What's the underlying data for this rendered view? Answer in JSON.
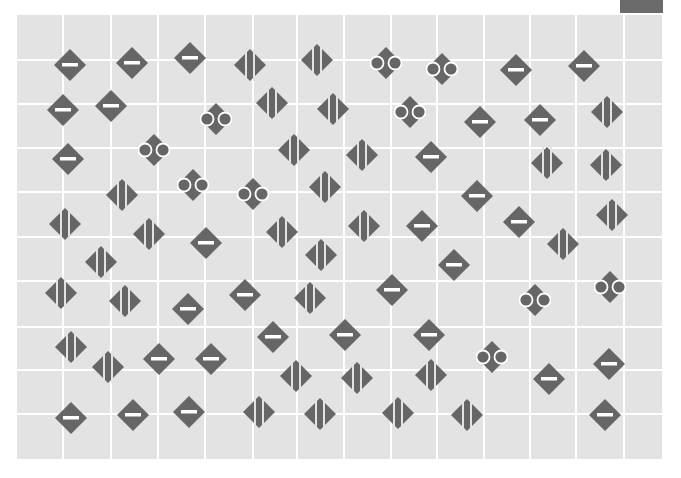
{
  "board": {
    "background": "#e3e3e3",
    "grid_color": "#ffffff",
    "piece_color": "#666666",
    "vertical_lines_x": [
      63,
      111,
      158,
      205,
      253,
      297,
      344,
      391,
      437,
      484,
      530,
      576,
      624
    ],
    "horizontal_lines_y": [
      60,
      104,
      148,
      192,
      237,
      281,
      327,
      370,
      414
    ]
  },
  "corner_block": {
    "color": "#6b6b6b"
  },
  "piece_types": {
    "dash": "diamond-with-horizontal-bar",
    "stripe": "diamond-with-vertical-stripes",
    "circles": "diamond-with-side-rings"
  },
  "pieces": [
    {
      "x": 70,
      "y": 65,
      "type": "dash"
    },
    {
      "x": 132,
      "y": 63,
      "type": "dash"
    },
    {
      "x": 190,
      "y": 58,
      "type": "dash"
    },
    {
      "x": 250,
      "y": 65,
      "type": "stripe"
    },
    {
      "x": 317,
      "y": 60,
      "type": "stripe"
    },
    {
      "x": 384,
      "y": 61,
      "type": "circles"
    },
    {
      "x": 440,
      "y": 67,
      "type": "circles"
    },
    {
      "x": 516,
      "y": 70,
      "type": "dash"
    },
    {
      "x": 584,
      "y": 66,
      "type": "dash"
    },
    {
      "x": 63,
      "y": 110,
      "type": "dash"
    },
    {
      "x": 111,
      "y": 106,
      "type": "dash"
    },
    {
      "x": 214,
      "y": 117,
      "type": "circles"
    },
    {
      "x": 272,
      "y": 103,
      "type": "stripe"
    },
    {
      "x": 333,
      "y": 109,
      "type": "stripe"
    },
    {
      "x": 408,
      "y": 110,
      "type": "circles"
    },
    {
      "x": 480,
      "y": 122,
      "type": "dash"
    },
    {
      "x": 540,
      "y": 120,
      "type": "dash"
    },
    {
      "x": 607,
      "y": 112,
      "type": "stripe"
    },
    {
      "x": 68,
      "y": 159,
      "type": "dash"
    },
    {
      "x": 152,
      "y": 148,
      "type": "circles"
    },
    {
      "x": 294,
      "y": 150,
      "type": "stripe"
    },
    {
      "x": 362,
      "y": 155,
      "type": "stripe"
    },
    {
      "x": 431,
      "y": 157,
      "type": "dash"
    },
    {
      "x": 547,
      "y": 163,
      "type": "stripe"
    },
    {
      "x": 606,
      "y": 165,
      "type": "stripe"
    },
    {
      "x": 122,
      "y": 195,
      "type": "stripe"
    },
    {
      "x": 191,
      "y": 183,
      "type": "circles"
    },
    {
      "x": 251,
      "y": 192,
      "type": "circles"
    },
    {
      "x": 325,
      "y": 187,
      "type": "stripe"
    },
    {
      "x": 477,
      "y": 196,
      "type": "dash"
    },
    {
      "x": 519,
      "y": 222,
      "type": "dash"
    },
    {
      "x": 612,
      "y": 215,
      "type": "stripe"
    },
    {
      "x": 65,
      "y": 224,
      "type": "stripe"
    },
    {
      "x": 149,
      "y": 234,
      "type": "stripe"
    },
    {
      "x": 206,
      "y": 243,
      "type": "dash"
    },
    {
      "x": 282,
      "y": 232,
      "type": "stripe"
    },
    {
      "x": 364,
      "y": 226,
      "type": "stripe"
    },
    {
      "x": 422,
      "y": 226,
      "type": "dash"
    },
    {
      "x": 454,
      "y": 265,
      "type": "dash"
    },
    {
      "x": 563,
      "y": 244,
      "type": "stripe"
    },
    {
      "x": 101,
      "y": 262,
      "type": "stripe"
    },
    {
      "x": 321,
      "y": 255,
      "type": "stripe"
    },
    {
      "x": 61,
      "y": 293,
      "type": "stripe"
    },
    {
      "x": 125,
      "y": 301,
      "type": "stripe"
    },
    {
      "x": 188,
      "y": 309,
      "type": "dash"
    },
    {
      "x": 245,
      "y": 295,
      "type": "dash"
    },
    {
      "x": 310,
      "y": 298,
      "type": "stripe"
    },
    {
      "x": 392,
      "y": 290,
      "type": "dash"
    },
    {
      "x": 533,
      "y": 298,
      "type": "circles"
    },
    {
      "x": 608,
      "y": 285,
      "type": "circles"
    },
    {
      "x": 71,
      "y": 347,
      "type": "stripe"
    },
    {
      "x": 273,
      "y": 337,
      "type": "dash"
    },
    {
      "x": 345,
      "y": 335,
      "type": "dash"
    },
    {
      "x": 429,
      "y": 335,
      "type": "dash"
    },
    {
      "x": 490,
      "y": 355,
      "type": "circles"
    },
    {
      "x": 108,
      "y": 367,
      "type": "stripe"
    },
    {
      "x": 159,
      "y": 359,
      "type": "dash"
    },
    {
      "x": 211,
      "y": 359,
      "type": "dash"
    },
    {
      "x": 296,
      "y": 376,
      "type": "stripe"
    },
    {
      "x": 357,
      "y": 378,
      "type": "stripe"
    },
    {
      "x": 431,
      "y": 375,
      "type": "stripe"
    },
    {
      "x": 549,
      "y": 379,
      "type": "dash"
    },
    {
      "x": 609,
      "y": 364,
      "type": "dash"
    },
    {
      "x": 71,
      "y": 418,
      "type": "dash"
    },
    {
      "x": 133,
      "y": 415,
      "type": "dash"
    },
    {
      "x": 189,
      "y": 412,
      "type": "dash"
    },
    {
      "x": 259,
      "y": 412,
      "type": "stripe"
    },
    {
      "x": 320,
      "y": 414,
      "type": "stripe"
    },
    {
      "x": 398,
      "y": 413,
      "type": "stripe"
    },
    {
      "x": 467,
      "y": 415,
      "type": "stripe"
    },
    {
      "x": 605,
      "y": 415,
      "type": "dash"
    }
  ]
}
